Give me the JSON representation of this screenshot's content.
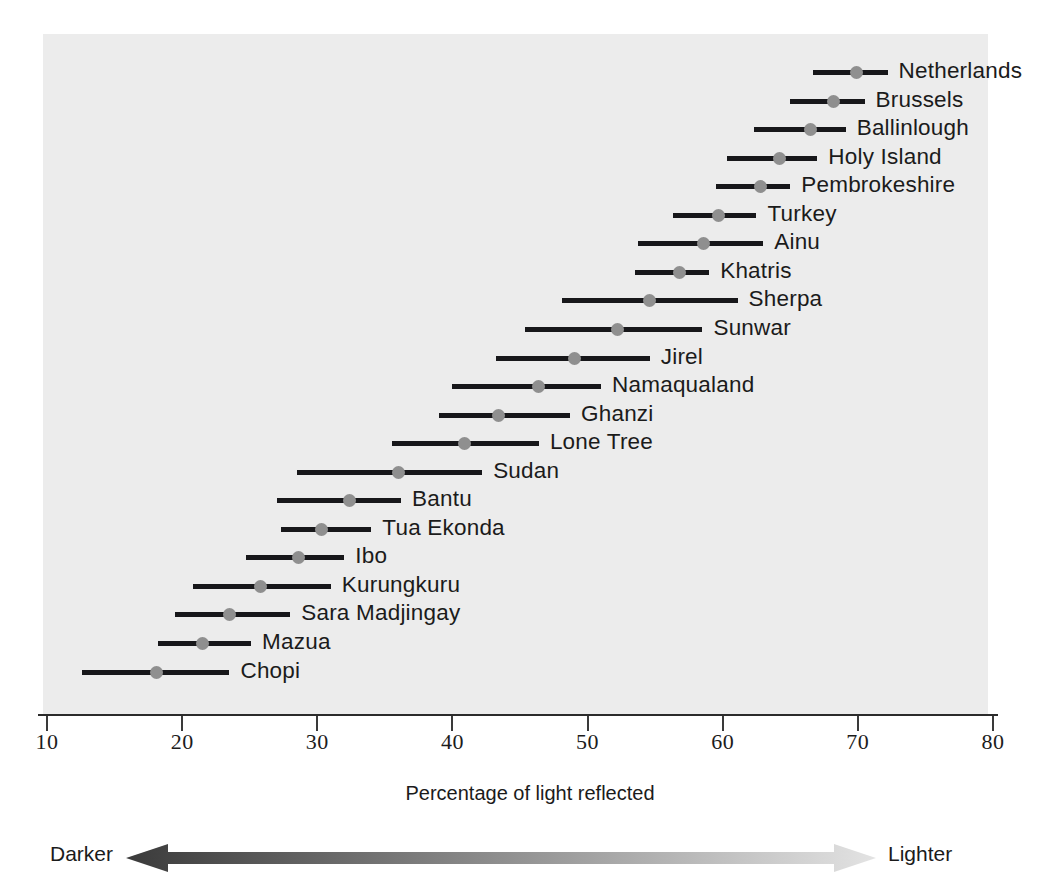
{
  "chart_data": {
    "type": "scatter",
    "title": "",
    "xlabel": "Percentage of light reflected",
    "ylabel": "",
    "xlim": [
      10,
      80
    ],
    "xticks": [
      10,
      20,
      30,
      40,
      50,
      60,
      70,
      80
    ],
    "xtick_labels": [
      "10",
      "20",
      "30",
      "40",
      "50",
      "60",
      "70",
      "80"
    ],
    "grid": false,
    "legend": "none",
    "series_note": "Each row shows a population group's skin reflectance: a horizontal range bar (min to max) with a dot at the mean value.",
    "categories": [
      "Netherlands",
      "Brussels",
      "Ballinlough",
      "Holy Island",
      "Pembrokeshire",
      "Turkey",
      "Ainu",
      "Khatris",
      "Sherpa",
      "Sunwar",
      "Jirel",
      "Namaqualand",
      "Ghanzi",
      "Lone Tree",
      "Sudan",
      "Bantu",
      "Tua Ekonda",
      "Ibo",
      "Kurungkuru",
      "Sara Madjingay",
      "Mazua",
      "Chopi"
    ],
    "rows": [
      {
        "label": "Netherlands",
        "low": 66.7,
        "value": 69.9,
        "high": 72.2
      },
      {
        "label": "Brussels",
        "low": 65.0,
        "value": 68.2,
        "high": 70.5
      },
      {
        "label": "Ballinlough",
        "low": 62.3,
        "value": 66.5,
        "high": 69.1
      },
      {
        "label": "Holy Island",
        "low": 60.3,
        "value": 64.2,
        "high": 67.0
      },
      {
        "label": "Pembrokeshire",
        "low": 59.5,
        "value": 62.8,
        "high": 65.0
      },
      {
        "label": "Turkey",
        "low": 56.3,
        "value": 59.7,
        "high": 62.5
      },
      {
        "label": "Ainu",
        "low": 53.7,
        "value": 58.6,
        "high": 63.0
      },
      {
        "label": "Khatris",
        "low": 53.5,
        "value": 56.8,
        "high": 59.0
      },
      {
        "label": "Sherpa",
        "low": 48.1,
        "value": 54.6,
        "high": 61.1
      },
      {
        "label": "Sunwar",
        "low": 45.4,
        "value": 52.2,
        "high": 58.5
      },
      {
        "label": "Jirel",
        "low": 43.2,
        "value": 49.0,
        "high": 54.6
      },
      {
        "label": "Namaqualand",
        "low": 40.0,
        "value": 46.4,
        "high": 51.0
      },
      {
        "label": "Ghanzi",
        "low": 39.0,
        "value": 43.4,
        "high": 48.7
      },
      {
        "label": "Lone Tree",
        "low": 35.5,
        "value": 40.9,
        "high": 46.4
      },
      {
        "label": "Sudan",
        "low": 28.5,
        "value": 36.0,
        "high": 42.2
      },
      {
        "label": "Bantu",
        "low": 27.0,
        "value": 32.4,
        "high": 36.2
      },
      {
        "label": "Tua Ekonda",
        "low": 27.3,
        "value": 30.3,
        "high": 34.0
      },
      {
        "label": "Ibo",
        "low": 24.7,
        "value": 28.6,
        "high": 32.0
      },
      {
        "label": "Kurungkuru",
        "low": 20.8,
        "value": 25.8,
        "high": 31.0
      },
      {
        "label": "Sara Madjingay",
        "low": 19.5,
        "value": 23.5,
        "high": 28.0
      },
      {
        "label": "Mazua",
        "low": 18.2,
        "value": 21.5,
        "high": 25.1
      },
      {
        "label": "Chopi",
        "low": 12.6,
        "value": 18.1,
        "high": 23.5
      }
    ]
  },
  "axis": {
    "title": "Percentage of light reflected"
  },
  "gradient_legend": {
    "left_label": "Darker",
    "right_label": "Lighter",
    "dark_color": "#3a3a3a",
    "light_color": "#e3e3e3"
  },
  "colors": {
    "plot_background": "#ececec",
    "range_line": "#17171a",
    "point": "#8f8f8f",
    "text": "#1b1b1b",
    "axis": "#2b2b2b"
  }
}
